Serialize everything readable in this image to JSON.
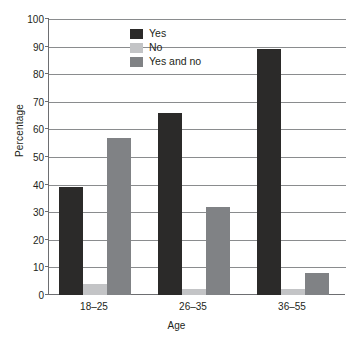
{
  "chart_data": {
    "type": "bar",
    "title": "",
    "subtitle": "",
    "xlabel": "Age",
    "ylabel": "Percentage",
    "categories": [
      "18–25",
      "26–35",
      "36–55"
    ],
    "series": [
      {
        "name": "Yes",
        "values": [
          39,
          66,
          89
        ],
        "color": "#2b2a29"
      },
      {
        "name": "No",
        "values": [
          4,
          2,
          2
        ],
        "color": "#c3c4c6"
      },
      {
        "name": "Yes and no",
        "values": [
          57,
          32,
          8
        ],
        "color": "#808285"
      }
    ],
    "ylim": [
      0,
      100
    ],
    "yticks": [
      0,
      10,
      20,
      30,
      40,
      50,
      60,
      70,
      80,
      90,
      100
    ],
    "ytick_labels": [
      "0",
      "10",
      "20",
      "30",
      "40",
      "50",
      "60",
      "70",
      "80",
      "90",
      "100"
    ],
    "grid": true,
    "grid_axis": "y",
    "legend_position": "upper-center-left",
    "axis_color": "#6d6e71",
    "grid_color": "#8a8c8e",
    "background": "#ffffff"
  }
}
